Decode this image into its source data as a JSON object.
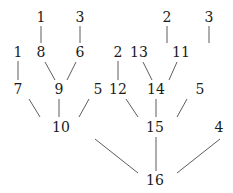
{
  "diagram": {
    "type": "tree",
    "nodes": [
      {
        "id": "n1a",
        "label": "1",
        "x": 41,
        "y": 17
      },
      {
        "id": "n3a",
        "label": "3",
        "x": 80,
        "y": 17
      },
      {
        "id": "n2a",
        "label": "2",
        "x": 167,
        "y": 17
      },
      {
        "id": "n3b",
        "label": "3",
        "x": 209,
        "y": 17
      },
      {
        "id": "n1b",
        "label": "1",
        "x": 18,
        "y": 52
      },
      {
        "id": "n8",
        "label": "8",
        "x": 41,
        "y": 52
      },
      {
        "id": "n6",
        "label": "6",
        "x": 80,
        "y": 52
      },
      {
        "id": "n2b",
        "label": "2",
        "x": 118,
        "y": 52
      },
      {
        "id": "n13",
        "label": "13",
        "x": 139,
        "y": 52
      },
      {
        "id": "n11",
        "label": "11",
        "x": 181,
        "y": 52
      },
      {
        "id": "n7",
        "label": "7",
        "x": 18,
        "y": 89
      },
      {
        "id": "n9",
        "label": "9",
        "x": 59,
        "y": 89
      },
      {
        "id": "n5a",
        "label": "5",
        "x": 98,
        "y": 89
      },
      {
        "id": "n12",
        "label": "12",
        "x": 118,
        "y": 89
      },
      {
        "id": "n14",
        "label": "14",
        "x": 156,
        "y": 89
      },
      {
        "id": "n5b",
        "label": "5",
        "x": 200,
        "y": 89
      },
      {
        "id": "n10",
        "label": "10",
        "x": 61,
        "y": 127
      },
      {
        "id": "n15",
        "label": "15",
        "x": 155,
        "y": 127
      },
      {
        "id": "n4",
        "label": "4",
        "x": 219,
        "y": 127
      },
      {
        "id": "n16",
        "label": "16",
        "x": 155,
        "y": 180
      }
    ],
    "edges": [
      {
        "x1": 41,
        "y1": 26,
        "x2": 41,
        "y2": 43
      },
      {
        "x1": 80,
        "y1": 26,
        "x2": 80,
        "y2": 43
      },
      {
        "x1": 167,
        "y1": 26,
        "x2": 167,
        "y2": 43
      },
      {
        "x1": 209,
        "y1": 26,
        "x2": 209,
        "y2": 43
      },
      {
        "x1": 18,
        "y1": 61,
        "x2": 18,
        "y2": 80
      },
      {
        "x1": 45,
        "y1": 62,
        "x2": 55,
        "y2": 80
      },
      {
        "x1": 76,
        "y1": 62,
        "x2": 67,
        "y2": 80
      },
      {
        "x1": 118,
        "y1": 61,
        "x2": 118,
        "y2": 80
      },
      {
        "x1": 143,
        "y1": 62,
        "x2": 152,
        "y2": 80
      },
      {
        "x1": 177,
        "y1": 62,
        "x2": 169,
        "y2": 80
      },
      {
        "x1": 29,
        "y1": 99,
        "x2": 40,
        "y2": 117
      },
      {
        "x1": 59,
        "y1": 99,
        "x2": 59,
        "y2": 117
      },
      {
        "x1": 89,
        "y1": 99,
        "x2": 79,
        "y2": 117
      },
      {
        "x1": 126,
        "y1": 99,
        "x2": 138,
        "y2": 117
      },
      {
        "x1": 156,
        "y1": 99,
        "x2": 156,
        "y2": 117
      },
      {
        "x1": 187,
        "y1": 99,
        "x2": 177,
        "y2": 117
      },
      {
        "x1": 95,
        "y1": 139,
        "x2": 138,
        "y2": 173
      },
      {
        "x1": 156,
        "y1": 137,
        "x2": 156,
        "y2": 171
      },
      {
        "x1": 220,
        "y1": 139,
        "x2": 177,
        "y2": 173
      }
    ]
  }
}
